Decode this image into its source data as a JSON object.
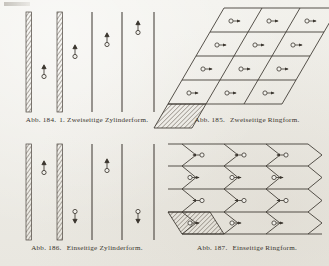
{
  "page": {
    "background_color": "#efeee9",
    "ink_color": "#2b2722",
    "top_artifact": "scan-smudge"
  },
  "figures": [
    {
      "id": "abb-184",
      "number": "Abb. 184.",
      "index": "1.",
      "title": "Zweiseitige Zylinderform.",
      "type": "vertical-lines",
      "hatched_bands": 2,
      "plain_lines": 3,
      "markers": [
        {
          "column": 1,
          "direction": "up"
        },
        {
          "column": 2,
          "direction": "up"
        },
        {
          "column": 3,
          "direction": "up"
        },
        {
          "column": 4,
          "direction": "up"
        }
      ]
    },
    {
      "id": "abb-185",
      "number": "Abb. 185.",
      "title": "Zweiseitige Ringform.",
      "type": "parallelogram-grid",
      "columns": 3,
      "rows": 4,
      "marker_glyph": "circle-arrow-right",
      "hatched_cell": "bottom-left",
      "cell_arrows": [
        [
          "right",
          "right",
          "right"
        ],
        [
          "right",
          "right",
          "right"
        ],
        [
          "right",
          "right",
          "right"
        ],
        [
          "right",
          "right",
          "right"
        ]
      ]
    },
    {
      "id": "abb-186",
      "number": "Abb. 186.",
      "title": "Einseitige Zylinderform.",
      "type": "vertical-lines",
      "hatched_bands": 2,
      "plain_lines": 3,
      "markers": [
        {
          "column": 1,
          "direction": "up"
        },
        {
          "column": 2,
          "direction": "down"
        },
        {
          "column": 3,
          "direction": "up"
        },
        {
          "column": 4,
          "direction": "down"
        }
      ]
    },
    {
      "id": "abb-187",
      "number": "Abb. 187.",
      "title": "Einseitige Ringform.",
      "type": "chevron-grid",
      "columns": 3,
      "rows": 4,
      "hatched_cell": "bottom-left",
      "cell_arrows": [
        [
          "left",
          "left",
          "left"
        ],
        [
          "right",
          "right",
          "right"
        ],
        [
          "left",
          "left",
          "left"
        ],
        [
          "right",
          "right",
          "right"
        ]
      ]
    }
  ]
}
